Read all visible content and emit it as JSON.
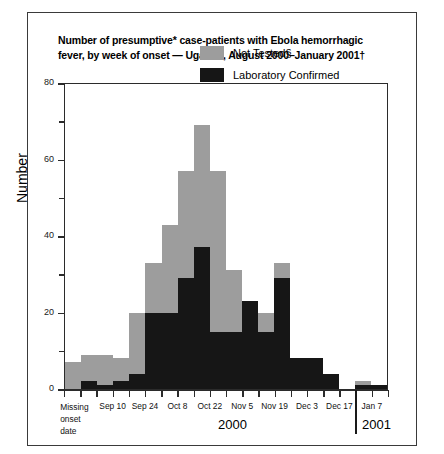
{
  "title": "Number of presumptive* case-patients with Ebola hemorrhagic fever, by week of onset — Uganda, August 2000–January 2001†",
  "legend": {
    "not_tested": "Not Tested§",
    "lab_confirmed": "Laboratory Confirmed"
  },
  "axes": {
    "ylabel": "Number",
    "yticks": [
      "0",
      "20",
      "40",
      "60",
      "80"
    ],
    "ymax": 80,
    "year_left": "2000",
    "year_right": "2001",
    "xlabels": [
      "Missing onset date",
      "Sep 10",
      "Sep 24",
      "Oct 8",
      "Oct 22",
      "Nov 5",
      "Nov 19",
      "Dec 3",
      "Dec 17",
      "Jan 7"
    ]
  },
  "colors": {
    "not_tested": "#9d9d9d",
    "lab_confirmed": "#161616",
    "axis": "#2b2b2b",
    "border": "#3a3a3a"
  },
  "chart_data": {
    "type": "bar",
    "title": "Number of presumptive* case-patients with Ebola hemorrhagic fever, by week of onset — Uganda, August 2000–January 2001†",
    "xlabel": "",
    "ylabel": "Number",
    "ylim": [
      0,
      80
    ],
    "grid": false,
    "stacked": true,
    "legend_position": "top-right",
    "categories": [
      "Missing onset date",
      "",
      "Sep 10",
      "",
      "Sep 24",
      "",
      "Oct 8",
      "",
      "Oct 22",
      "",
      "Nov 5",
      "",
      "Nov 19",
      "",
      "Dec 3",
      "",
      "Dec 17",
      "",
      "Jan 7",
      ""
    ],
    "series": [
      {
        "name": "Laboratory Confirmed",
        "values": [
          0,
          2,
          1,
          2,
          4,
          20,
          20,
          29,
          37,
          15,
          15,
          23,
          15,
          29,
          8,
          8,
          4,
          0,
          1,
          1
        ]
      },
      {
        "name": "Not Tested§",
        "values": [
          7,
          7,
          8,
          6,
          16,
          13,
          23,
          28,
          32,
          42,
          16,
          0,
          5,
          4,
          0,
          0,
          0,
          0,
          1,
          0
        ]
      }
    ],
    "totals": [
      7,
      9,
      9,
      8,
      20,
      33,
      43,
      57,
      69,
      57,
      31,
      23,
      20,
      33,
      8,
      8,
      4,
      0,
      2,
      1
    ]
  }
}
